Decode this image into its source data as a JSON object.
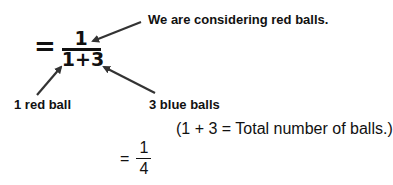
{
  "annotation_top": "We are considering red balls.",
  "handwritten_fraction": {
    "equals": "=",
    "numerator": "1",
    "denominator": "1+3"
  },
  "label_left": "1 red ball",
  "label_right": "3 blue balls",
  "note": "(1 + 3 = Total number of balls.)",
  "result": {
    "equals": "=",
    "numerator": "1",
    "denominator": "4"
  }
}
